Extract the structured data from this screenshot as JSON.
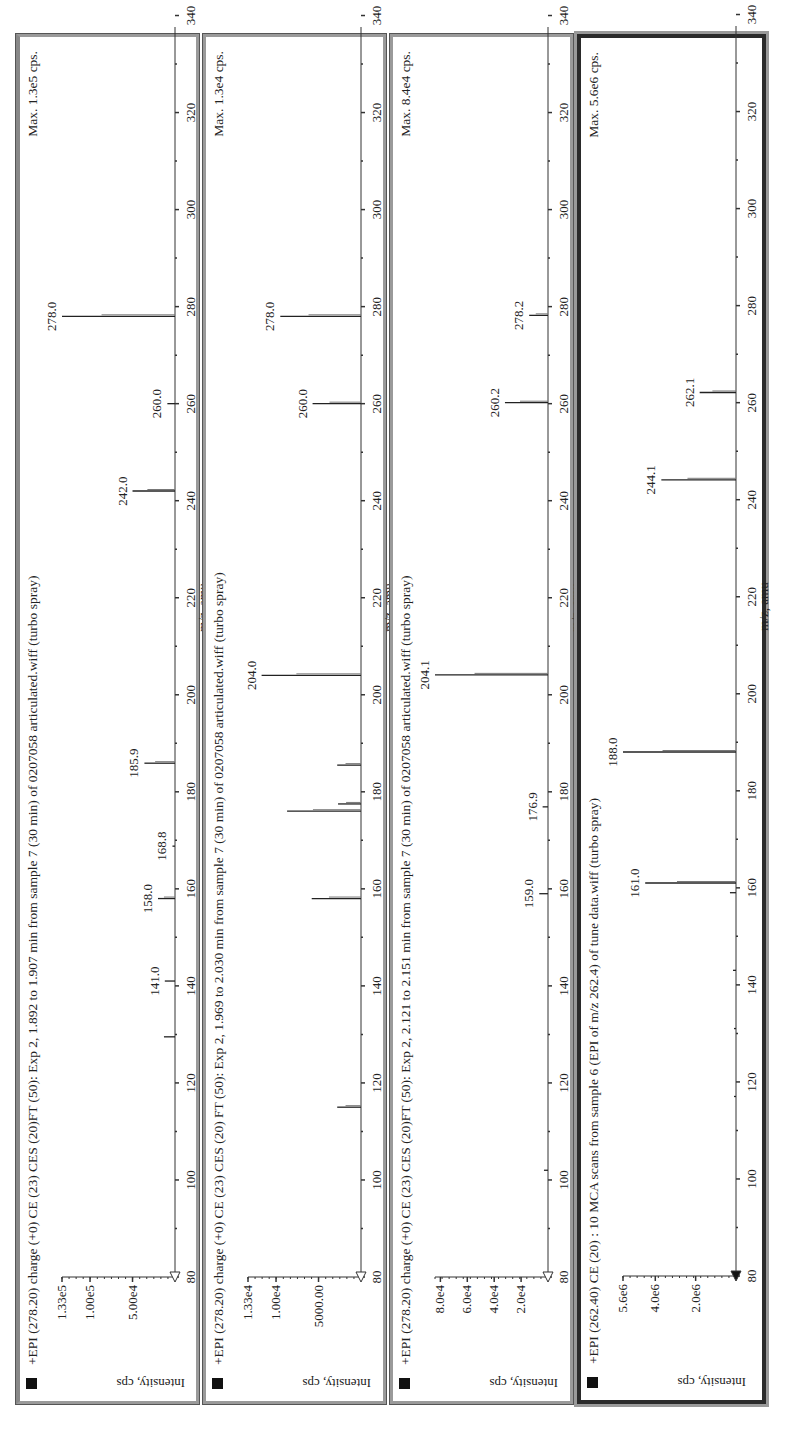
{
  "chart_data": [
    {
      "type": "bar",
      "panel_index": 1,
      "title": "+EPI (278.20) charge (+0) CE (23)  CES (20)FT (50): Exp 2, 1.892 to 1.907 min from sample 7 (30 min) of 0207058 articulated.wiff (turbo spray)",
      "max_label": "Max. 1.3e5 cps.",
      "xlabel": "m/z, amu",
      "ylabel": "Intensity, cps",
      "xlim": [
        80,
        350
      ],
      "x_ticks": [
        "80",
        "100",
        "120",
        "140",
        "160",
        "180",
        "200",
        "220",
        "240",
        "260",
        "280",
        "300",
        "320",
        "340"
      ],
      "ylim": [
        0,
        133000
      ],
      "y_ticks": [
        {
          "label": "1.33e5",
          "value": 133000
        },
        {
          "label": "1.00e5",
          "value": 100000
        },
        {
          "label": "5.00e4",
          "value": 50000
        }
      ],
      "peaks": [
        {
          "mz": 129.5,
          "intensity": 13000,
          "label": ""
        },
        {
          "mz": 141.0,
          "intensity": 12000,
          "label": "141.0"
        },
        {
          "mz": 158.0,
          "intensity": 20000,
          "label": "158.0"
        },
        {
          "mz": 168.8,
          "intensity": 3000,
          "label": "168.8"
        },
        {
          "mz": 185.9,
          "intensity": 36000,
          "label": "185.9"
        },
        {
          "mz": 242.0,
          "intensity": 50000,
          "label": "242.0"
        },
        {
          "mz": 260.0,
          "intensity": 9000,
          "label": "260.0"
        },
        {
          "mz": 278.0,
          "intensity": 133000,
          "label": "278.0"
        }
      ]
    },
    {
      "type": "bar",
      "panel_index": 2,
      "title": "+EPI (278.20) charge (+0) CE (23) CES (20) FT (50): Exp 2, 1.969 to 2.030 min from sample 7 (30 min) of 0207058 articulated.wiff (turbo spray)",
      "max_label": "Max. 1.3e4 cps.",
      "xlabel": "m/z, amu",
      "ylabel": "Intensity, cps",
      "xlim": [
        80,
        350
      ],
      "x_ticks": [
        "80",
        "100",
        "120",
        "140",
        "160",
        "180",
        "200",
        "220",
        "240",
        "260",
        "280",
        "300",
        "320",
        "340"
      ],
      "ylim": [
        0,
        13300
      ],
      "y_ticks": [
        {
          "label": "1.33e4",
          "value": 13300
        },
        {
          "label": "1.00e4",
          "value": 10000
        },
        {
          "label": "5000.00",
          "value": 5000
        }
      ],
      "peaks": [
        {
          "mz": 115.0,
          "intensity": 2800,
          "label": ""
        },
        {
          "mz": 158.0,
          "intensity": 5800,
          "label": ""
        },
        {
          "mz": 176.0,
          "intensity": 8700,
          "label": ""
        },
        {
          "mz": 177.5,
          "intensity": 2700,
          "label": ""
        },
        {
          "mz": 185.5,
          "intensity": 2800,
          "label": ""
        },
        {
          "mz": 204.0,
          "intensity": 11700,
          "label": "204.0"
        },
        {
          "mz": 260.0,
          "intensity": 5700,
          "label": "260.0"
        },
        {
          "mz": 278.0,
          "intensity": 9500,
          "label": "278.0"
        }
      ]
    },
    {
      "type": "bar",
      "panel_index": 3,
      "title": "+EPI (278.20) charge (+0) CE (23) CES (20)FT (50): Exp 2, 2.121 to 2.151 min from sample 7 (30 min) of 0207058 articulated.wiff (turbo spray)",
      "max_label": "Max. 8.4e4 cps.",
      "xlabel": "m/z, amu",
      "ylabel": "Intensity, cps",
      "xlim": [
        80,
        350
      ],
      "x_ticks": [
        "80",
        "100",
        "120",
        "140",
        "160",
        "180",
        "200",
        "220",
        "240",
        "260",
        "280",
        "300",
        "320",
        "340"
      ],
      "ylim": [
        0,
        84000
      ],
      "y_ticks": [
        {
          "label": "8.0e4",
          "value": 80000
        },
        {
          "label": "6.0e4",
          "value": 60000
        },
        {
          "label": "4.0e4",
          "value": 40000
        },
        {
          "label": "2.0e4",
          "value": 20000
        }
      ],
      "peaks": [
        {
          "mz": 102.0,
          "intensity": 3000,
          "label": ""
        },
        {
          "mz": 159.0,
          "intensity": 6500,
          "label": "159.0"
        },
        {
          "mz": 176.9,
          "intensity": 4000,
          "label": "176.9"
        },
        {
          "mz": 204.1,
          "intensity": 84000,
          "label": "204.1"
        },
        {
          "mz": 260.2,
          "intensity": 32000,
          "label": "260.2"
        },
        {
          "mz": 278.2,
          "intensity": 14000,
          "label": "278.2"
        }
      ]
    },
    {
      "type": "bar",
      "panel_index": 4,
      "title": "+EPI (262.40) CE (20) : 10 MCA scans from sample 6 (EPI of m/z 262.4) of tune data.wiff (turbo spray)",
      "max_label": "Max. 5.6e6 cps.",
      "xlabel": "m/z, amu",
      "ylabel": "Intensity, cps",
      "xlim": [
        80,
        350
      ],
      "x_ticks": [
        "80",
        "100",
        "120",
        "140",
        "160",
        "180",
        "200",
        "220",
        "240",
        "260",
        "280",
        "300",
        "320",
        "340"
      ],
      "ylim": [
        0,
        5600000
      ],
      "y_ticks": [
        {
          "label": "5.6e6",
          "value": 5600000
        },
        {
          "label": "4.0e6",
          "value": 4000000
        },
        {
          "label": "2.0e6",
          "value": 2000000
        }
      ],
      "peaks": [
        {
          "mz": 117.0,
          "intensity": 100000,
          "label": ""
        },
        {
          "mz": 131.0,
          "intensity": 100000,
          "label": ""
        },
        {
          "mz": 143.0,
          "intensity": 150000,
          "label": ""
        },
        {
          "mz": 159.0,
          "intensity": 300000,
          "label": ""
        },
        {
          "mz": 161.0,
          "intensity": 4500000,
          "label": "161.0"
        },
        {
          "mz": 188.0,
          "intensity": 5600000,
          "label": "188.0"
        },
        {
          "mz": 244.1,
          "intensity": 3700000,
          "label": "244.1"
        },
        {
          "mz": 262.1,
          "intensity": 1800000,
          "label": "262.1"
        }
      ]
    }
  ]
}
